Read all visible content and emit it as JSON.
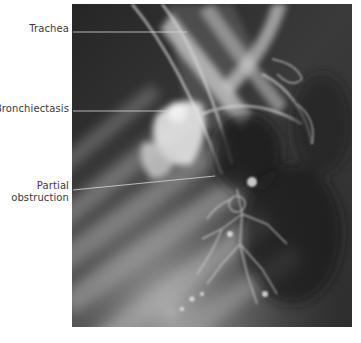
{
  "figure": {
    "image_description": "Chest radiograph / bronchogram showing airway anatomy",
    "labels": [
      {
        "id": "trachea",
        "text": "Trachea"
      },
      {
        "id": "bronchiectasis",
        "text": "Bronchiectasis"
      },
      {
        "id": "partial_obstruction_line1",
        "text": "Partial"
      },
      {
        "id": "partial_obstruction_line2",
        "text": "obstruction"
      }
    ]
  },
  "colors": {
    "background": "#ffffff",
    "label_text": "#3a3a3a",
    "leader_line": "#d8d8d8",
    "xray_dark": "#2a2a2a"
  }
}
